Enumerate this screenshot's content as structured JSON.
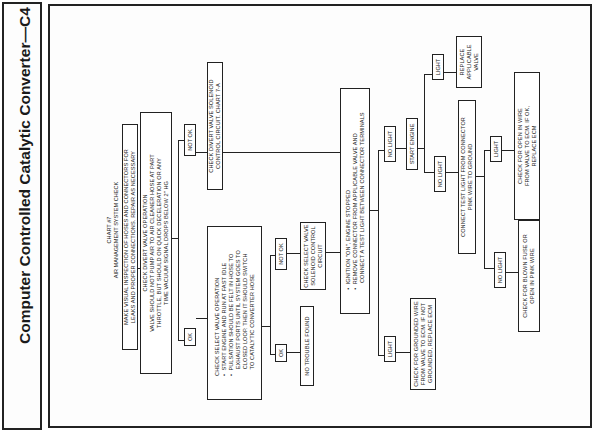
{
  "page_title": "Computer Controlled Catalytic Converter—C4",
  "chart": {
    "heading_line1": "CHART #7",
    "heading_line2": "AIR MANAGEMENT SYSTEM CHECK",
    "nodes": {
      "visual_inspection": {
        "line1": "MAKE VISUAL INSPECTION OF HOSES AND CONNECTORS FOR",
        "line2": "LEAKS AND PROPER CONNECTIONS. REPAIR AS NECESSARY"
      },
      "divert_valve": {
        "line1": "CHECK DIVERT VALVE OPERATION",
        "line2": "VALVE SHOULD NOT PUMP AIR TO AIR CLEANER HOSE AT PART",
        "line3": "THROTTLE, BUT SHOULD ON QUICK DECELERATION OR ANY",
        "line4": "TIME VACUUM SIGNAL DROPS BELOW 2\" HG"
      },
      "divert_solenoid": {
        "line1": "CHECK DIVERT VALVE SOLENOID",
        "line2": "CONTROL CIRCUIT. CHART 7-A"
      },
      "select_valve": {
        "line1": "CHECK SELECT VALVE OPERATION",
        "line2": "•  START ENGINE AND RUN AT FAST IDLE",
        "line3": "•  PULSATION SHOULD BE FELT IN HOSE TO",
        "line4": "    EXHAUST PORTS UNTIL SYSTEM GOES TO",
        "line5": "    CLOSED LOOP. THEN IT SHOULD SWITCH",
        "line6": "    TO CATALYTIC CONVERTER HOSE"
      },
      "no_trouble": {
        "line1": "NO TROUBLE FOUND"
      },
      "select_solenoid": {
        "line1": "CHECK SELECT VALVE",
        "line2": "SOLENOID CONTROL",
        "line3": "CIRCUIT"
      },
      "ignition_on": {
        "line1": "•  IGNITION \"ON\", ENGINE STOPPED",
        "line2": "•  REMOVE CONNECTOR FROM APPLICABLE VALVE AND",
        "line3": "    CONNECT A TEST LIGHT BETWEEN CONNECTOR TERMINALS"
      },
      "grounded_wire": {
        "line1": "CHECK FOR GROUNDED WIRE",
        "line2": "FROM VALVE TO ECM. IF NOT",
        "line3": "GROUNDED, REPLACE ECM"
      },
      "start_engine": {
        "line1": "START ENGINE"
      },
      "replace_valve": {
        "line1": "REPLACE",
        "line2": "APPLICABLE",
        "line3": "VALVE"
      },
      "connect_test_light": {
        "line1": "CONNECT TEST LIGHT FROM CONNECTOR",
        "line2": "PINK WIRE TO GROUND"
      },
      "open_wire": {
        "line1": "CHECK FOR OPEN IN WIRE",
        "line2": "FROM VALVE TO ECM. IF OK,",
        "line3": "REPLACE ECM"
      },
      "blown_fuse": {
        "line1": "CHECK FOR BLOWN FUSE OR",
        "line2": "OPEN IN PINK WIRE"
      }
    },
    "branch_labels": {
      "divert_not_ok": "NOT OK",
      "divert_ok": "OK",
      "select_not_ok": "NOT OK",
      "select_ok": "OK",
      "ignition_no_light": "NO LIGHT",
      "ignition_light": "LIGHT",
      "start_light": "LIGHT",
      "start_no_light": "NO LIGHT",
      "ground_light": "LIGHT",
      "ground_no_light": "NO LIGHT"
    }
  }
}
